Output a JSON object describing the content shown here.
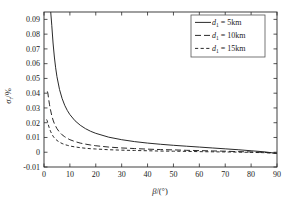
{
  "chart_data": {
    "type": "line",
    "title": "",
    "xlabel": "β/(°)",
    "ylabel": "σ_r/%",
    "ylabel_main": "σ",
    "ylabel_sub": "r",
    "ylabel_unit": "/%",
    "xlabel_main": "β",
    "xlabel_unit": "/(°)",
    "xlim": [
      0,
      90
    ],
    "ylim": [
      -0.01,
      0.095
    ],
    "xticks": [
      0,
      10,
      20,
      30,
      40,
      50,
      60,
      70,
      80,
      90
    ],
    "xtick_labels": [
      "0",
      "10",
      "20",
      "30",
      "40",
      "50",
      "60",
      "70",
      "80",
      "90"
    ],
    "yticks": [
      -0.01,
      0,
      0.01,
      0.02,
      0.03,
      0.04,
      0.05,
      0.06,
      0.07,
      0.08,
      0.09
    ],
    "ytick_labels": [
      "-0.01",
      "0",
      "0.01",
      "0.02",
      "0.03",
      "0.04",
      "0.05",
      "0.06",
      "0.07",
      "0.08",
      "0.09"
    ],
    "grid": false,
    "legend_position": "top-right",
    "series": [
      {
        "name": "d_1 = 5km",
        "label_main": "d",
        "label_sub": "1",
        "label_rest": " = 5km",
        "dash": "none",
        "dash_array": "",
        "x": [
          2.6,
          3.0,
          3.5,
          4.0,
          4.5,
          5.0,
          6.0,
          7.0,
          8.0,
          9.0,
          10.0,
          12.0,
          14.0,
          16.0,
          18.0,
          20.0,
          25.0,
          30.0,
          35.0,
          40.0,
          45.0,
          50.0,
          55.0,
          60.0,
          65.0,
          70.0,
          75.0,
          80.0,
          85.0,
          90.0
        ],
        "y": [
          0.095,
          0.086,
          0.074,
          0.0645,
          0.0572,
          0.0512,
          0.0425,
          0.0364,
          0.0318,
          0.0283,
          0.0255,
          0.0213,
          0.0183,
          0.016,
          0.0142,
          0.0128,
          0.0102,
          0.0085,
          0.0072,
          0.0062,
          0.0054,
          0.0047,
          0.0041,
          0.0035,
          0.0029,
          0.0023,
          0.0017,
          0.001,
          0.0003,
          -0.0008
        ]
      },
      {
        "name": "d_1 = 10km",
        "label_main": "d",
        "label_sub": "1",
        "label_rest": " = 10km",
        "dash": "long-dash",
        "dash_array": "6,3",
        "x": [
          1.3,
          1.5,
          1.8,
          2.1,
          2.5,
          3.0,
          3.5,
          4.0,
          5.0,
          6.0,
          7.0,
          8.0,
          9.0,
          10.0,
          12.0,
          14.0,
          16.0,
          18.0,
          20.0,
          25.0,
          30.0,
          35.0,
          40.0,
          45.0,
          50.0,
          55.0,
          60.0,
          65.0,
          70.0,
          75.0,
          80.0,
          85.0,
          90.0
        ],
        "y": [
          0.0412,
          0.04,
          0.036,
          0.0325,
          0.0288,
          0.0248,
          0.0218,
          0.0194,
          0.016,
          0.0136,
          0.0118,
          0.0105,
          0.0094,
          0.0085,
          0.0072,
          0.0062,
          0.0055,
          0.0049,
          0.0044,
          0.0035,
          0.0029,
          0.0025,
          0.0021,
          0.0018,
          0.0016,
          0.0013,
          0.0011,
          0.0009,
          0.0007,
          0.0004,
          0.0002,
          -0.0001,
          -0.0006
        ]
      },
      {
        "name": "d_1 = 15km",
        "label_main": "d",
        "label_sub": "1",
        "label_rest": " = 15km",
        "dash": "short-dash",
        "dash_array": "3.2,2.4",
        "x": [
          1.0,
          1.2,
          1.5,
          1.8,
          2.1,
          2.5,
          3.0,
          3.5,
          4.0,
          5.0,
          6.0,
          7.0,
          8.0,
          9.0,
          10.0,
          12.0,
          14.0,
          16.0,
          18.0,
          20.0,
          25.0,
          30.0,
          35.0,
          40.0,
          45.0,
          50.0,
          55.0,
          60.0,
          65.0,
          70.0,
          75.0,
          80.0,
          85.0,
          90.0
        ],
        "y": [
          0.0222,
          0.0215,
          0.0196,
          0.0178,
          0.0161,
          0.0143,
          0.0124,
          0.0109,
          0.0097,
          0.008,
          0.0068,
          0.0059,
          0.0052,
          0.0047,
          0.0042,
          0.0036,
          0.0031,
          0.0027,
          0.0024,
          0.0022,
          0.0017,
          0.0014,
          0.0012,
          0.001,
          0.0008,
          0.0007,
          0.0006,
          0.0004,
          0.0003,
          0.0002,
          0.0001,
          -0.0001,
          -0.0003,
          -0.0007
        ]
      }
    ]
  },
  "legend": {
    "entries": [
      {
        "label_main": "d",
        "label_sub": "1",
        "label_rest": " = 5km"
      },
      {
        "label_main": "d",
        "label_sub": "1",
        "label_rest": " = 10km"
      },
      {
        "label_main": "d",
        "label_sub": "1",
        "label_rest": " = 15km"
      }
    ]
  },
  "colors": {
    "curve": "#1f1f1f",
    "frame": "#2a2a2a",
    "background": "#ffffff",
    "text": "#1a1a1a"
  }
}
